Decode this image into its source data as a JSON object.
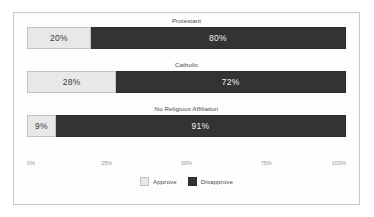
{
  "chart_data": {
    "type": "bar",
    "orientation": "horizontal",
    "stacked": true,
    "normalized": true,
    "title": "",
    "xlabel": "",
    "ylabel": "",
    "xlim": [
      0,
      100
    ],
    "grid": false,
    "legend_position": "bottom-center",
    "categories": [
      "Protestant",
      "Catholic",
      "No Religious Affiliation"
    ],
    "tick_labels": [
      "0%",
      "25%",
      "50%",
      "75%",
      "100%"
    ],
    "tick_values": [
      0,
      25,
      50,
      75,
      100
    ],
    "series": [
      {
        "name": "Approve",
        "color": "#e8e8e8",
        "values": [
          20,
          28,
          9
        ],
        "labels": [
          "20%",
          "28%",
          "9%"
        ]
      },
      {
        "name": "Disapprove",
        "color": "#333333",
        "values": [
          80,
          72,
          91
        ],
        "labels": [
          "80%",
          "72%",
          "91%"
        ]
      }
    ],
    "bars": [
      {
        "category": "Protestant",
        "approve_value": 20,
        "approve_label": "20%",
        "disapprove_value": 80,
        "disapprove_label": "80%"
      },
      {
        "category": "Catholic",
        "approve_value": 28,
        "approve_label": "28%",
        "disapprove_value": 72,
        "disapprove_label": "72%"
      },
      {
        "category": "No Religious Affiliation",
        "approve_value": 9,
        "approve_label": "9%",
        "disapprove_value": 91,
        "disapprove_label": "91%"
      }
    ]
  },
  "legend": {
    "items": [
      {
        "label": "Approve"
      },
      {
        "label": "Disapprove"
      }
    ]
  },
  "colors": {
    "approve": "#e8e8e8",
    "disapprove": "#333333",
    "frame_border": "#c9c9c9",
    "background": "#fdfdfd",
    "tick_text": "#9a9a9a",
    "label_text": "#4a4a4a"
  }
}
